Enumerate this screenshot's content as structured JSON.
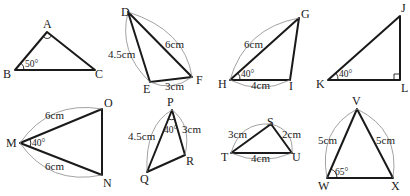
{
  "figures": {
    "abc": {
      "vertices": {
        "A": "A",
        "B": "B",
        "C": "C"
      },
      "angle_B": "50°",
      "right_angle_at": "A"
    },
    "def": {
      "vertices": {
        "D": "D",
        "E": "E",
        "F": "F"
      },
      "side_DE": "4.5cm",
      "side_DF": "6cm",
      "side_EF": "3cm"
    },
    "ghi": {
      "vertices": {
        "G": "G",
        "H": "H",
        "I": "I"
      },
      "side_GH": "6cm",
      "side_HI": "4cm",
      "angle_H": "40°"
    },
    "jkl": {
      "vertices": {
        "J": "J",
        "K": "K",
        "L": "L"
      },
      "angle_K": "40°",
      "right_angle_at": "L"
    },
    "mno": {
      "vertices": {
        "M": "M",
        "N": "N",
        "O": "O"
      },
      "side_MO": "6cm",
      "side_MN": "6cm",
      "angle_M": "40°"
    },
    "pqr": {
      "vertices": {
        "P": "P",
        "Q": "Q",
        "R": "R"
      },
      "side_PQ": "4.5cm",
      "side_PR": "3cm",
      "angle_P": "40°"
    },
    "stu": {
      "vertices": {
        "S": "S",
        "T": "T",
        "U": "U"
      },
      "side_ST": "3cm",
      "side_SU": "2cm",
      "side_TU": "4cm"
    },
    "vwx": {
      "vertices": {
        "V": "V",
        "W": "W",
        "X": "X"
      },
      "side_VW": "5cm",
      "side_VX": "5cm",
      "angle_W": "65°"
    }
  }
}
